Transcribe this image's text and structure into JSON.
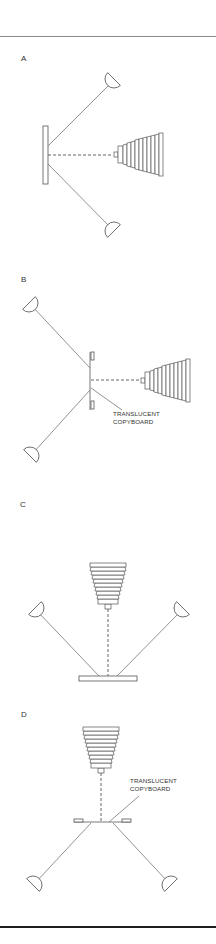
{
  "figure": {
    "panels": [
      {
        "id": "A",
        "label": "A",
        "description": "Copyboard vertical, camera horizontal, two lights at 45 degrees"
      },
      {
        "id": "B",
        "label": "B",
        "description": "Translucent copyboard, backlit, camera horizontal",
        "annotation": [
          "TRANSLUCENT",
          "COPYBOARD"
        ]
      },
      {
        "id": "C",
        "label": "C",
        "description": "Copyboard horizontal, camera overhead, two lights at 45 degrees"
      },
      {
        "id": "D",
        "label": "D",
        "description": "Translucent copyboard horizontal, camera overhead, lights below",
        "annotation": [
          "TRANSLUCENT",
          "COPYBOARD"
        ]
      }
    ],
    "colors": {
      "line": "#777777",
      "outline": "#555555",
      "text": "#333333",
      "rule_bottom": "#1e1e1e"
    }
  }
}
